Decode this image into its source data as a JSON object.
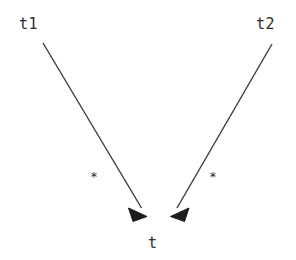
{
  "diagram": {
    "type": "uml-association",
    "background_color": "#ffffff",
    "line_color": "#3c3c3c",
    "text_color": "#2b2b2b",
    "width": 296,
    "height": 260,
    "nodes": [
      {
        "id": "t1",
        "label": "t1",
        "role": "source-left",
        "x": 19,
        "y": 17
      },
      {
        "id": "t2",
        "label": "t2",
        "role": "source-right",
        "x": 256,
        "y": 17
      },
      {
        "id": "t",
        "label": "t",
        "role": "target",
        "x": 148,
        "y": 236
      }
    ],
    "edges": [
      {
        "id": "edge-t1-t",
        "from": "t1",
        "to": "t",
        "multiplicity_label": "*",
        "multiplicity_x": 90,
        "multiplicity_y": 170,
        "x1": 43,
        "y1": 43,
        "x2": 146,
        "y2": 214,
        "arrowhead": "filled-triangle"
      },
      {
        "id": "edge-t2-t",
        "from": "t2",
        "to": "t",
        "multiplicity_label": "*",
        "multiplicity_x": 209,
        "multiplicity_y": 170,
        "x1": 272,
        "y1": 44,
        "x2": 172,
        "y2": 214,
        "arrowhead": "filled-triangle"
      }
    ]
  }
}
